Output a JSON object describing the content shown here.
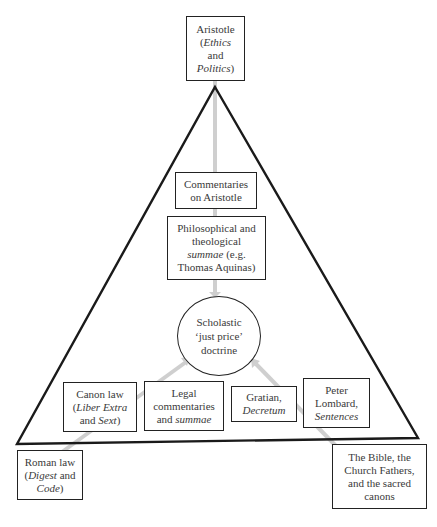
{
  "diagram": {
    "type": "triangle influence diagram",
    "center": {
      "lines": [
        "Scholastic",
        "‘just price’",
        "doctrine"
      ]
    },
    "top_source": {
      "name": "Aristotle",
      "work_prefix": "(",
      "work_italic_1": "Ethics",
      "work_mid": "and",
      "work_italic_2": "Politics",
      "work_suffix": ")"
    },
    "left_source": {
      "line1": "Roman law",
      "open": "(",
      "italic_1": "Digest",
      "mid": " and",
      "italic_2": "Code",
      "close": ")"
    },
    "right_source": {
      "lines": [
        "The Bible, the",
        "Church Fathers,",
        "and the sacred",
        "canons"
      ]
    },
    "inner_boxes": {
      "commentaries": {
        "lines": [
          "Commentaries",
          "on Aristotle"
        ]
      },
      "philosophical": {
        "line1": "Philosophical and",
        "line2": "theological",
        "italic": "summae",
        "after_italic": " (e.g.",
        "line4": "Thomas Aquinas)"
      },
      "canon_law": {
        "line1": "Canon law",
        "open": "(",
        "italic_1": "Liber Extra",
        "mid": "and ",
        "italic_2": "Sext",
        "close": ")"
      },
      "legal_commentaries": {
        "line1": "Legal",
        "line2": "commentaries",
        "prefix3": "and ",
        "italic": "summae"
      },
      "gratian": {
        "line1": "Gratian,",
        "italic": "Decretum"
      },
      "peter_lombard": {
        "line1": "Peter",
        "line2": "Lombard,",
        "italic": "Sentences"
      }
    },
    "arrows": [
      {
        "from": "Aristotle",
        "to": "Scholastic just price doctrine",
        "color": "#d0d0d0"
      },
      {
        "from": "Roman law",
        "to": "Scholastic just price doctrine",
        "color": "#d0d0d0"
      },
      {
        "from": "The Bible, the Church Fathers, and the sacred canons",
        "to": "Scholastic just price doctrine",
        "color": "#d0d0d0"
      }
    ],
    "colors": {
      "line": "#1a1a1a",
      "arrow": "#cfcfcf",
      "text": "#3a3a3a"
    }
  }
}
